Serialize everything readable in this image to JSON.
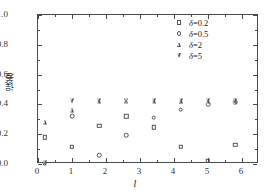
{
  "chart_data": {
    "type": "scatter",
    "title": "",
    "xlabel": "l",
    "ylabel": "误差",
    "xlim": [
      0,
      6.5
    ],
    "ylim": [
      0.0,
      1.0
    ],
    "x_ticks": [
      "0",
      "1",
      "2",
      "3",
      "4",
      "5",
      "6"
    ],
    "x_tick_values": [
      0,
      1,
      2,
      3,
      4,
      5,
      6
    ],
    "y_ticks": [
      "0.0",
      "0.2",
      "0.4",
      "0.6",
      "0.8",
      "1.0"
    ],
    "y_tick_values": [
      0.0,
      0.2,
      0.4,
      0.6,
      0.8,
      1.0
    ],
    "grid": false,
    "legend_position": "top-right",
    "x": [
      0.2,
      1.0,
      1.8,
      2.6,
      3.4,
      4.2,
      5.0,
      5.8
    ],
    "series": [
      {
        "name": "δ=0.2",
        "marker": "square",
        "values": [
          0.18,
          0.115,
          0.255,
          0.32,
          0.245,
          0.115,
          0.02,
          0.13
        ]
      },
      {
        "name": "δ=0.5",
        "marker": "circle",
        "values": [
          0.005,
          0.32,
          0.06,
          0.195,
          0.31,
          0.365,
          0.4,
          0.415
        ]
      },
      {
        "name": "δ=2",
        "marker": "triangle-up",
        "values": [
          0.285,
          0.365,
          0.42,
          0.422,
          0.422,
          0.425,
          0.422,
          0.422
        ]
      },
      {
        "name": "δ=5",
        "marker": "triangle-down",
        "values": [
          0.01,
          0.42,
          0.422,
          0.423,
          0.423,
          0.426,
          0.424,
          0.423
        ]
      }
    ]
  },
  "legend": {
    "entries": [
      {
        "label": "δ=0.2",
        "symbol": "square-marker-icon"
      },
      {
        "label": "δ=0.5",
        "symbol": "circle-marker-icon"
      },
      {
        "label": "δ=2",
        "symbol": "triangle-up-marker-icon"
      },
      {
        "label": "δ=5",
        "symbol": "triangle-down-marker-icon"
      }
    ]
  },
  "colors": {
    "marker": "#555555",
    "axis": "#4a4a4a",
    "text": "#222222",
    "background": "#ffffff"
  }
}
